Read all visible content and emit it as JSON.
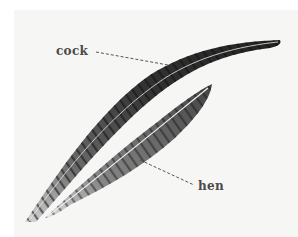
{
  "image": {
    "description": "Photograph of two pheasant tail feathers with labels",
    "background_color": "#ffffff",
    "photo_background_color": "#f6f6f4"
  },
  "labels": {
    "cock": "cock",
    "hen": "hen"
  },
  "colors": {
    "label_text": "#4a4a4a",
    "feather_dark": "#2b2b2b",
    "feather_mid": "#6a6a6a",
    "feather_light": "#cfcfcf",
    "leader_line": "#555555"
  }
}
